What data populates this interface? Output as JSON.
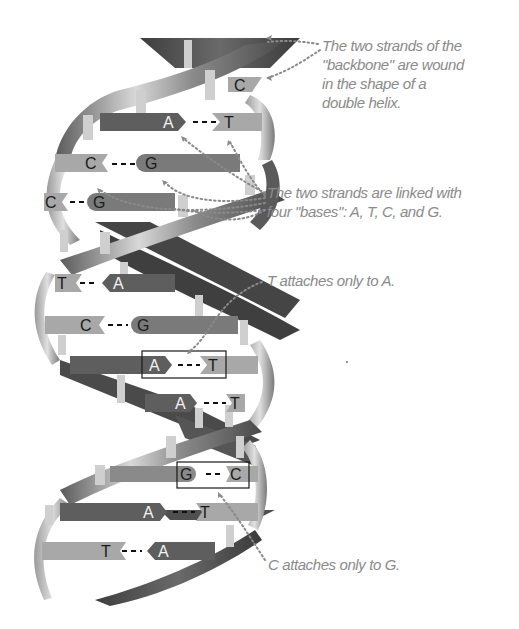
{
  "diagram": {
    "type": "dna-double-helix-illustration",
    "colors": {
      "background": "#ffffff",
      "backbone_dark": "#4a4a4a",
      "backbone_mid": "#7a7a7a",
      "backbone_light": "#c8c8c8",
      "base_light": "#a8a8a8",
      "base_dark": "#5e5e5e",
      "callout_text": "#8a8a8a",
      "dotted_leader": "#8a8a8a",
      "highlight_box": "#1a1a1a"
    },
    "base_pairs": [
      {
        "left": "",
        "right": "C",
        "partial": true
      },
      {
        "left": "A",
        "right": "T"
      },
      {
        "left": "C",
        "right": "G"
      },
      {
        "left": "C",
        "right": "G"
      },
      {
        "left": "T",
        "right": "A"
      },
      {
        "left": "C",
        "right": "G"
      },
      {
        "left": "A",
        "right": "T",
        "highlighted": true
      },
      {
        "left": "A",
        "right": "T"
      },
      {
        "left": "G",
        "right": "C",
        "highlighted": true
      },
      {
        "left": "A",
        "right": "T"
      },
      {
        "left": "T",
        "right": "A"
      }
    ],
    "bond_symbol": "- - -"
  },
  "callouts": [
    {
      "id": "backbone",
      "lines": [
        "The two strands of the",
        "\"backbone\" are wound",
        "in the shape of a",
        "double helix."
      ]
    },
    {
      "id": "bases",
      "lines": [
        "The two strands are linked with",
        "four \"bases\": A, T, C, and G."
      ]
    },
    {
      "id": "t-a",
      "lines": [
        "T attaches only to A."
      ]
    },
    {
      "id": "c-g",
      "lines": [
        "C attaches only to G."
      ]
    }
  ]
}
